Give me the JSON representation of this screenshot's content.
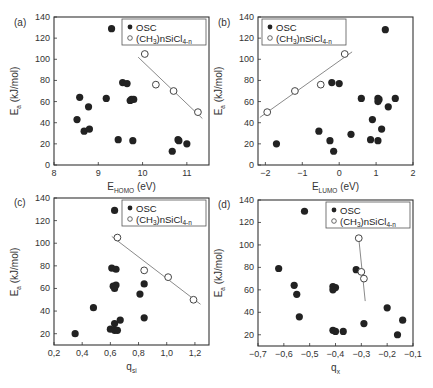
{
  "figure": {
    "colors": {
      "osc_fill": "#222222",
      "fit_line": "#8a8a8a",
      "frame": "#333333",
      "open_marker_stroke": "#444444"
    }
  },
  "chart_data": [
    {
      "panel": "(a)",
      "type": "scatter",
      "title": "",
      "xlabel": "E_HOMO (eV)",
      "xlabel_main": "E",
      "xlabel_sub": "HOMO",
      "xlabel_tail": " (eV)",
      "ylabel": "E_a (kJ/mol)",
      "xlim": [
        8,
        11.5
      ],
      "ylim": [
        0,
        140
      ],
      "xticks": [
        8,
        9,
        10,
        11
      ],
      "xtick_labels": [
        "8",
        "9",
        "10",
        "11"
      ],
      "yticks": [
        0,
        20,
        40,
        60,
        80,
        100,
        120,
        140
      ],
      "ytick_labels": [
        "0",
        "20",
        "40",
        "60",
        "80",
        "100",
        "120",
        "140"
      ],
      "legend": {
        "position": "upper right",
        "entries": [
          "OSC",
          "(CH3)nSiCl4-n"
        ]
      },
      "series": [
        {
          "name": "OSC",
          "marker": "filled-circle",
          "points": [
            [
              9.3,
              129
            ],
            [
              8.58,
              64
            ],
            [
              8.78,
              55
            ],
            [
              9.18,
              63
            ],
            [
              9.55,
              78
            ],
            [
              9.65,
              77
            ],
            [
              9.72,
              61
            ],
            [
              9.75,
              62
            ],
            [
              9.8,
              62
            ],
            [
              8.52,
              43
            ],
            [
              8.68,
              32
            ],
            [
              8.8,
              34
            ],
            [
              9.45,
              24
            ],
            [
              9.78,
              23
            ],
            [
              10.67,
              13
            ],
            [
              10.8,
              24
            ],
            [
              10.82,
              23
            ],
            [
              11.0,
              20
            ]
          ]
        },
        {
          "name": "(CH3)nSiCl4-n",
          "marker": "open-circle",
          "points": [
            [
              10.05,
              105
            ],
            [
              10.3,
              76
            ],
            [
              10.7,
              70
            ],
            [
              11.25,
              50
            ]
          ],
          "fit_line": [
            [
              9.9,
              102
            ],
            [
              11.35,
              44
            ]
          ]
        }
      ]
    },
    {
      "panel": "(b)",
      "type": "scatter",
      "title": "",
      "xlabel": "E_LUMO (eV)",
      "xlabel_main": "E",
      "xlabel_sub": "LUMO",
      "xlabel_tail": " (eV)",
      "ylabel": "E_a (kJ/mol)",
      "xlim": [
        -2.2,
        2
      ],
      "ylim": [
        0,
        140
      ],
      "xticks": [
        -2,
        -1,
        0,
        1,
        2
      ],
      "xtick_labels": [
        "−2",
        "−1",
        "0",
        "1",
        "2"
      ],
      "yticks": [
        0,
        20,
        40,
        60,
        80,
        100,
        120,
        140
      ],
      "ytick_labels": [
        "0",
        "20",
        "40",
        "60",
        "80",
        "100",
        "120",
        "140"
      ],
      "legend": {
        "position": "upper left",
        "entries": [
          "OSC",
          "(CH3)nSiCl4-n"
        ]
      },
      "series": [
        {
          "name": "OSC",
          "marker": "filled-circle",
          "points": [
            [
              1.25,
              128
            ],
            [
              -0.2,
              78
            ],
            [
              0.0,
              77
            ],
            [
              0.6,
              63
            ],
            [
              1.05,
              63
            ],
            [
              1.08,
              62
            ],
            [
              1.05,
              60
            ],
            [
              1.52,
              63
            ],
            [
              1.33,
              55
            ],
            [
              0.9,
              43
            ],
            [
              1.15,
              34
            ],
            [
              -0.55,
              32
            ],
            [
              0.32,
              29
            ],
            [
              -0.25,
              23
            ],
            [
              0.85,
              24
            ],
            [
              1.05,
              23
            ],
            [
              -0.15,
              13
            ],
            [
              -1.7,
              20
            ]
          ]
        },
        {
          "name": "(CH3)nSiCl4-n",
          "marker": "open-circle",
          "points": [
            [
              0.15,
              105
            ],
            [
              -0.5,
              76
            ],
            [
              -1.2,
              70
            ],
            [
              -1.95,
              50
            ]
          ],
          "fit_line": [
            [
              -2.15,
              45
            ],
            [
              0.35,
              107
            ]
          ]
        }
      ]
    },
    {
      "panel": "(c)",
      "type": "scatter",
      "title": "",
      "xlabel": "q_Si",
      "xlabel_main": "q",
      "xlabel_sub": "si",
      "xlabel_tail": "",
      "ylabel": "E_a (kJ/mol)",
      "xlim": [
        0.2,
        1.3
      ],
      "ylim": [
        10,
        140
      ],
      "xticks": [
        0.2,
        0.4,
        0.6,
        0.8,
        1.0,
        1.2
      ],
      "xtick_labels": [
        "0,2",
        "0,4",
        "0,6",
        "0,8",
        "1,0",
        "1,2"
      ],
      "yticks": [
        20,
        40,
        60,
        80,
        100,
        120,
        140
      ],
      "ytick_labels": [
        "20",
        "40",
        "60",
        "80",
        "100",
        "120",
        "140"
      ],
      "legend": {
        "position": "upper right",
        "entries": [
          "OSC",
          "(CH3)nSiCl4-n"
        ]
      },
      "series": [
        {
          "name": "OSC",
          "marker": "filled-circle",
          "points": [
            [
              0.63,
              129
            ],
            [
              0.61,
              78
            ],
            [
              0.64,
              77
            ],
            [
              0.62,
              62
            ],
            [
              0.64,
              63
            ],
            [
              0.63,
              60
            ],
            [
              0.84,
              64
            ],
            [
              0.81,
              55
            ],
            [
              0.48,
              43
            ],
            [
              0.84,
              34
            ],
            [
              0.67,
              32
            ],
            [
              0.63,
              29
            ],
            [
              0.6,
              24
            ],
            [
              0.63,
              23
            ],
            [
              0.65,
              23
            ],
            [
              0.35,
              20
            ]
          ]
        },
        {
          "name": "(CH3)nSiCl4-n",
          "marker": "open-circle",
          "points": [
            [
              0.65,
              105
            ],
            [
              0.84,
              76
            ],
            [
              1.01,
              70
            ],
            [
              1.19,
              50
            ]
          ],
          "fit_line": [
            [
              0.61,
              106
            ],
            [
              1.24,
              46
            ]
          ]
        }
      ]
    },
    {
      "panel": "(d)",
      "type": "scatter",
      "title": "",
      "xlabel": "q_X",
      "xlabel_main": "q",
      "xlabel_sub": "x",
      "xlabel_tail": "",
      "ylabel": "E_a (kJ/mol)",
      "xlim": [
        -0.7,
        -0.1
      ],
      "ylim": [
        10,
        140
      ],
      "xticks": [
        -0.7,
        -0.6,
        -0.5,
        -0.4,
        -0.3,
        -0.2,
        -0.1
      ],
      "xtick_labels": [
        "−0,7",
        "−0,6",
        "−0,5",
        "−0,4",
        "−0,3",
        "−0,2",
        "−0,1"
      ],
      "yticks": [
        20,
        40,
        60,
        80,
        100,
        120,
        140
      ],
      "ytick_labels": [
        "20",
        "40",
        "60",
        "80",
        "100",
        "120",
        "140"
      ],
      "legend": {
        "position": "upper right",
        "entries": [
          "OSC",
          "(CH3)nSiCl4-n"
        ]
      },
      "series": [
        {
          "name": "OSC",
          "marker": "filled-circle",
          "points": [
            [
              -0.52,
              130
            ],
            [
              -0.62,
              79
            ],
            [
              -0.32,
              78
            ],
            [
              -0.56,
              64
            ],
            [
              -0.55,
              56
            ],
            [
              -0.41,
              63
            ],
            [
              -0.4,
              62
            ],
            [
              -0.41,
              60
            ],
            [
              -0.54,
              36
            ],
            [
              -0.2,
              44
            ],
            [
              -0.14,
              33
            ],
            [
              -0.29,
              30
            ],
            [
              -0.41,
              24
            ],
            [
              -0.4,
              23
            ],
            [
              -0.37,
              23
            ],
            [
              -0.16,
              20
            ]
          ]
        },
        {
          "name": "(CH3)nSiCl4-n",
          "marker": "open-circle",
          "points": [
            [
              -0.31,
              106
            ],
            [
              -0.3,
              76
            ],
            [
              -0.29,
              70
            ]
          ],
          "fit_line": [
            [
              -0.31,
              106
            ],
            [
              -0.285,
              50
            ]
          ]
        }
      ]
    }
  ],
  "legend_labels": {
    "osc": "OSC",
    "silane_main": "(CH",
    "silane_sub3": "3",
    "silane_mid": ")nSiCl",
    "silane_sub4n": "4-n"
  },
  "ylabel_main": "E",
  "ylabel_sub": "a",
  "ylabel_tail": "  (kJ/mol)"
}
